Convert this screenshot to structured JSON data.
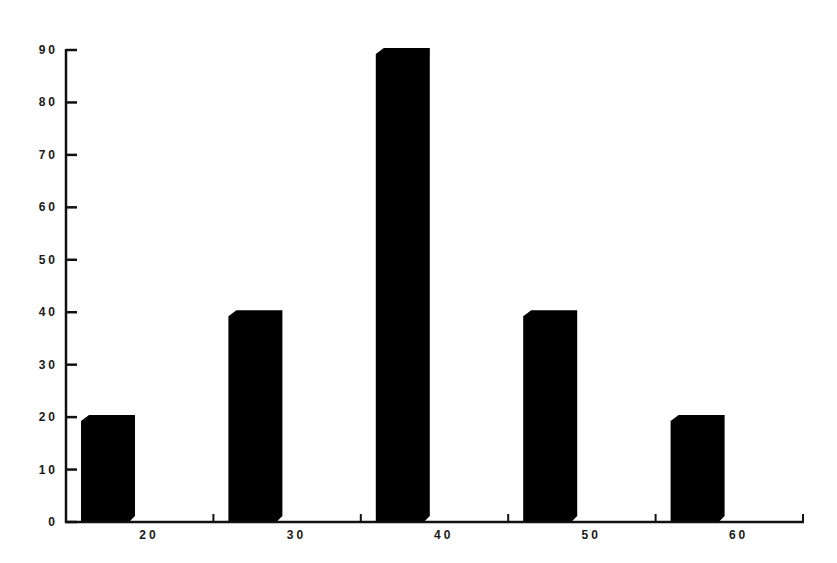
{
  "chart_data": {
    "type": "bar",
    "title": "",
    "xlabel": "",
    "ylabel": "",
    "categories": [
      "20",
      "30",
      "40",
      "50",
      "60"
    ],
    "values": [
      20,
      40,
      90,
      40,
      20
    ],
    "ylim": [
      0,
      90
    ],
    "yticks": [
      0,
      10,
      20,
      30,
      40,
      50,
      60,
      70,
      80,
      90
    ],
    "grid": false,
    "legend": null,
    "style": "3d-beveled-black-bars"
  },
  "colors": {
    "bar": "#000000",
    "axis": "#111111",
    "background": "#ffffff"
  }
}
